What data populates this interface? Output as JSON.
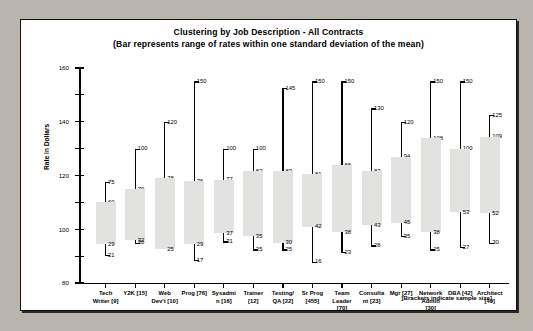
{
  "chart_data": {
    "type": "bar",
    "title": "Clustering by Job Description - All Contracts",
    "subtitle": "(Bar represents range of rates within one standard deviation of the mean)",
    "ylabel": "Rate in Dollars",
    "xlabel": "",
    "footnote": "[Brackets indicate sample size]",
    "ylim": [
      0,
      160
    ],
    "yticks": [
      0,
      20,
      40,
      60,
      80,
      100,
      120,
      140,
      160
    ],
    "grid": false,
    "legend": "none",
    "categories": [
      "Tech Writer [9]",
      "Y2K [15]",
      "Web Dev't [10]",
      "Prog [76]",
      "Sysadmin [16]",
      "Trainer [12]",
      "Testing/ QA [22]",
      "Sr Prog [455]",
      "Team Leader [70]",
      "Consultant [23]",
      "Mgr [27]",
      "Network Admin [30]",
      "DBA [42]",
      "Architect [49]"
    ],
    "category_lines": [
      [
        "Tech",
        "Writer [9]"
      ],
      [
        "Y2K [15]"
      ],
      [
        "Web",
        "Dev't [10]"
      ],
      [
        "Prog [76]"
      ],
      [
        "Sysadmi",
        "n [16]"
      ],
      [
        "Trainer",
        "[12]"
      ],
      [
        "Testing/",
        "QA [22]"
      ],
      [
        "Sr Prog",
        "[455]"
      ],
      [
        "Team",
        "Leader",
        "[70]"
      ],
      [
        "Consulta",
        "nt [23]"
      ],
      [
        "Mgr [27]"
      ],
      [
        "Network",
        "Admin",
        "[30]"
      ],
      [
        "DBA [42]"
      ],
      [
        "Architect",
        "[49]"
      ]
    ],
    "series": [
      {
        "name": "max",
        "values": [
          75,
          100,
          120,
          150,
          100,
          100,
          145,
          150,
          150,
          130,
          120,
          150,
          150,
          125
        ]
      },
      {
        "name": "box_top",
        "values": [
          60,
          70,
          78,
          76,
          77,
          83,
          83,
          81,
          88,
          83,
          94,
          108,
          100,
          109
        ]
      },
      {
        "name": "box_bot",
        "values": [
          29,
          32,
          25,
          29,
          37,
          35,
          30,
          42,
          38,
          43,
          45,
          38,
          53,
          52
        ]
      },
      {
        "name": "min",
        "values": [
          21,
          30,
          null,
          17,
          31,
          25,
          25,
          16,
          23,
          28,
          35,
          25,
          27,
          30
        ]
      }
    ],
    "points": [
      {
        "category": "Tech Writer [9]",
        "max": 75,
        "box_top": 60,
        "box_bot": 29,
        "min": 21
      },
      {
        "category": "Y2K [15]",
        "max": 100,
        "box_top": 70,
        "box_bot": 32,
        "min": 30
      },
      {
        "category": "Web Dev't [10]",
        "max": 120,
        "box_top": 78,
        "box_bot": 25,
        "min": null
      },
      {
        "category": "Prog [76]",
        "max": 150,
        "box_top": 76,
        "box_bot": 29,
        "min": 17
      },
      {
        "category": "Sysadmin [16]",
        "max": 100,
        "box_top": 77,
        "box_bot": 37,
        "min": 31
      },
      {
        "category": "Trainer [12]",
        "max": 100,
        "box_top": 83,
        "box_bot": 35,
        "min": 25
      },
      {
        "category": "Testing/ QA [22]",
        "max": 145,
        "box_top": 83,
        "box_bot": 30,
        "min": 25
      },
      {
        "category": "Sr Prog [455]",
        "max": 150,
        "box_top": 81,
        "box_bot": 42,
        "min": 16
      },
      {
        "category": "Team Leader [70]",
        "max": 150,
        "box_top": 88,
        "box_bot": 38,
        "min": 23
      },
      {
        "category": "Consultant [23]",
        "max": 130,
        "box_top": 83,
        "box_bot": 43,
        "min": 28
      },
      {
        "category": "Mgr [27]",
        "max": 120,
        "box_top": 94,
        "box_bot": 45,
        "min": 35
      },
      {
        "category": "Network Admin [30]",
        "max": 150,
        "box_top": 108,
        "box_bot": 38,
        "min": 25
      },
      {
        "category": "DBA [42]",
        "max": 150,
        "box_top": 100,
        "box_bot": 53,
        "min": 27
      },
      {
        "category": "Architect [49]",
        "max": 125,
        "box_top": 109,
        "box_bot": 52,
        "min": 30
      }
    ],
    "colors": {
      "box_fill": "#e2e2e0",
      "line": "#000000",
      "frame_bg": "#ffffff",
      "page_bg": "#b9b5ac"
    }
  }
}
